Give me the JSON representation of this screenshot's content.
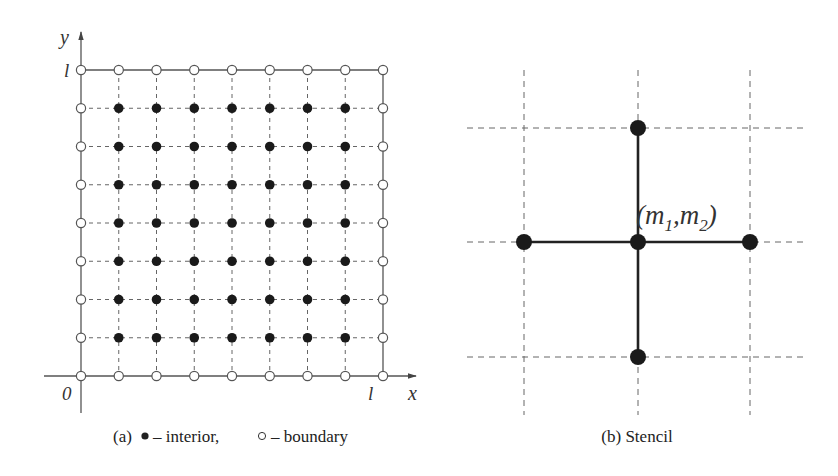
{
  "panel_a": {
    "caption": "(a) • – interior, ∘ – boundary",
    "caption_parts": {
      "prefix": "(a)",
      "interior_label": "– interior,",
      "boundary_label": "– boundary"
    },
    "axis_x_label": "x",
    "axis_y_label": "y",
    "origin_label": "0",
    "x_end_label": "l",
    "y_end_label": "l",
    "grid": {
      "nodes_per_side": 9,
      "intervals": 8
    },
    "legend": {
      "interior": "filled circle",
      "boundary": "open circle"
    }
  },
  "panel_b": {
    "caption": "(b) Stencil",
    "center_label": "(m₁,m₂)",
    "center_label_parts": {
      "open": "(m",
      "sub1": "1",
      "comma": ",m",
      "sub2": "2",
      "close": ")"
    },
    "stencil_points": [
      "center",
      "left",
      "right",
      "top",
      "bottom"
    ]
  },
  "colors": {
    "line": "#555555",
    "node_fill": "#1a1a1a",
    "dashed": "#666666",
    "background": "#ffffff"
  }
}
